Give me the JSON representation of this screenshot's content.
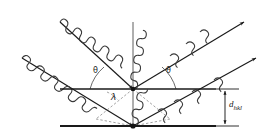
{
  "figure": {
    "name": "bragg-diffraction-diagram",
    "background_color": "#ffffff",
    "stroke_color": "#1a1a1a",
    "dash_color": "#7a7a7a",
    "width": 268,
    "height": 140
  },
  "labels": {
    "theta_left": "θ",
    "theta_right": "θ",
    "lambda": "λ",
    "d_spacing_symbol": "d",
    "d_spacing_subscript": "hkl"
  },
  "geometry": {
    "plane_upper_y": 89,
    "plane_lower_y": 126,
    "plane_x_start": 60,
    "plane_x_end": 216,
    "scatter_upper": [
      133,
      89
    ],
    "scatter_lower": [
      133,
      126
    ],
    "normal_top_y": 22,
    "incident_ray_1_start": [
      60,
      22
    ],
    "incident_ray_2_start": [
      22,
      58
    ],
    "reflected_ray_1_end": [
      244,
      22
    ],
    "reflected_ray_2_end": [
      256,
      58
    ],
    "theta_degrees": 45,
    "wave_amplitude": 5,
    "wave_period": 13
  },
  "elements": {
    "incident_rays": 2,
    "reflected_rays": 2,
    "atomic_planes": 2,
    "normal_line": 1,
    "angle_arcs": 2,
    "path_difference_marks": 2,
    "dimension_arrow": 1
  }
}
